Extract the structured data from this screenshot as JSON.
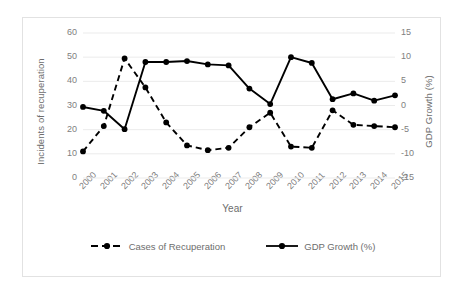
{
  "chart_data": {
    "type": "line",
    "title": "",
    "xlabel": "Year",
    "categories": [
      "2000",
      "2001",
      "2002",
      "2003",
      "2004",
      "2005",
      "2006",
      "2007",
      "2008",
      "2009",
      "2010",
      "2011",
      "2012",
      "2013",
      "2014",
      "2015"
    ],
    "grid": true,
    "legend_position": "bottom",
    "axes": {
      "left": {
        "label": "Incidents of recuperation",
        "min": 0,
        "max": 60,
        "step": 10,
        "ticks": [
          "0",
          "10",
          "20",
          "30",
          "40",
          "50",
          "60"
        ]
      },
      "right": {
        "label": "GDP Growth (%)",
        "min": -15,
        "max": 15,
        "step": 5,
        "ticks": [
          "-15",
          "-10",
          "-5",
          "0",
          "5",
          "10",
          "15"
        ]
      }
    },
    "series": [
      {
        "name": "Cases of Recuperation",
        "axis": "left",
        "style": "dashed",
        "color": "#000000",
        "values": [
          11,
          21.5,
          49.5,
          37.5,
          23,
          13.5,
          11.5,
          12.5,
          21,
          27,
          13,
          12.5,
          28,
          22,
          21.5,
          21
        ]
      },
      {
        "name": "GDP Growth (%)",
        "axis": "right",
        "style": "solid",
        "color": "#000000",
        "values": [
          -0.3,
          -1.1,
          -4.9,
          9.0,
          9.0,
          9.2,
          8.5,
          8.3,
          3.5,
          0.3,
          10.0,
          8.8,
          1.3,
          2.5,
          1.0,
          2.1
        ]
      }
    ]
  },
  "legend": {
    "items": [
      {
        "label": "Cases of Recuperation"
      },
      {
        "label": "GDP Growth (%)"
      }
    ]
  }
}
